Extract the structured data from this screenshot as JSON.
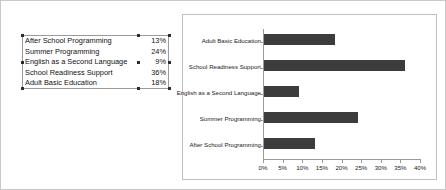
{
  "table": {
    "rows": [
      {
        "label": "After School Programming",
        "value": "13%"
      },
      {
        "label": "Summer Programming",
        "value": "24%"
      },
      {
        "label": "English as a Second Language",
        "value": "9%"
      },
      {
        "label": "School Readiness Support",
        "value": "36%"
      },
      {
        "label": "Adult Basic Education",
        "value": "18%"
      }
    ]
  },
  "chart_data": {
    "type": "bar",
    "orientation": "horizontal",
    "title": "",
    "xlabel": "",
    "ylabel": "",
    "xlim": [
      0,
      40
    ],
    "grid": false,
    "legend": false,
    "bar_color": "#3c3c3c",
    "axis_color": "#9a9a9a",
    "categories": [
      "Adult Basic Education",
      "School Readiness Support",
      "English as a Second Language",
      "Summer Programming",
      "After School Programming"
    ],
    "values": [
      18,
      36,
      9,
      24,
      13
    ],
    "value_labels": [
      "18%",
      "36%",
      "9%",
      "24%",
      "13%"
    ],
    "xticks": [
      0,
      5,
      10,
      15,
      20,
      25,
      30,
      35,
      40
    ],
    "xticklabels": [
      "0%",
      "5%",
      "10%",
      "15%",
      "20%",
      "25%",
      "30%",
      "35%",
      "40%"
    ]
  }
}
